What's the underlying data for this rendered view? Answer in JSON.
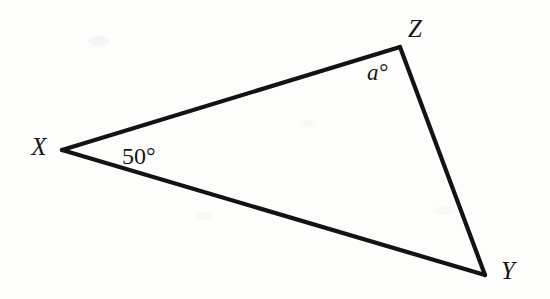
{
  "figure": {
    "type": "geometry-diagram",
    "shape": "triangle",
    "background_color": "#fdfdfc",
    "stroke_color": "#131313",
    "stroke_width": 4.2,
    "canvas": {
      "width": 550,
      "height": 299
    },
    "vertices": [
      {
        "id": "X",
        "label": "X",
        "x": 62,
        "y": 150,
        "label_x": 39,
        "label_y": 155
      },
      {
        "id": "Z",
        "label": "Z",
        "x": 400,
        "y": 47,
        "label_x": 415,
        "label_y": 37
      },
      {
        "id": "Y",
        "label": "Y",
        "x": 485,
        "y": 275,
        "label_x": 508,
        "label_y": 279
      }
    ],
    "edges": [
      {
        "id": "XZ",
        "from": "X",
        "to": "Z"
      },
      {
        "id": "ZY",
        "from": "Z",
        "to": "Y"
      },
      {
        "id": "YX",
        "from": "Y",
        "to": "X"
      }
    ],
    "angle_labels": [
      {
        "id": "angle-at-X",
        "at_vertex": "X",
        "text": "50°",
        "value": 50,
        "unit": "degrees",
        "style": "upright",
        "x": 122,
        "y": 164
      },
      {
        "id": "angle-at-Z",
        "at_vertex": "Z",
        "text": "a°",
        "value": "a",
        "unit": "degrees",
        "style": "italic",
        "x": 367,
        "y": 80
      }
    ],
    "polygon_points": "62,150 400,47 485,275"
  }
}
